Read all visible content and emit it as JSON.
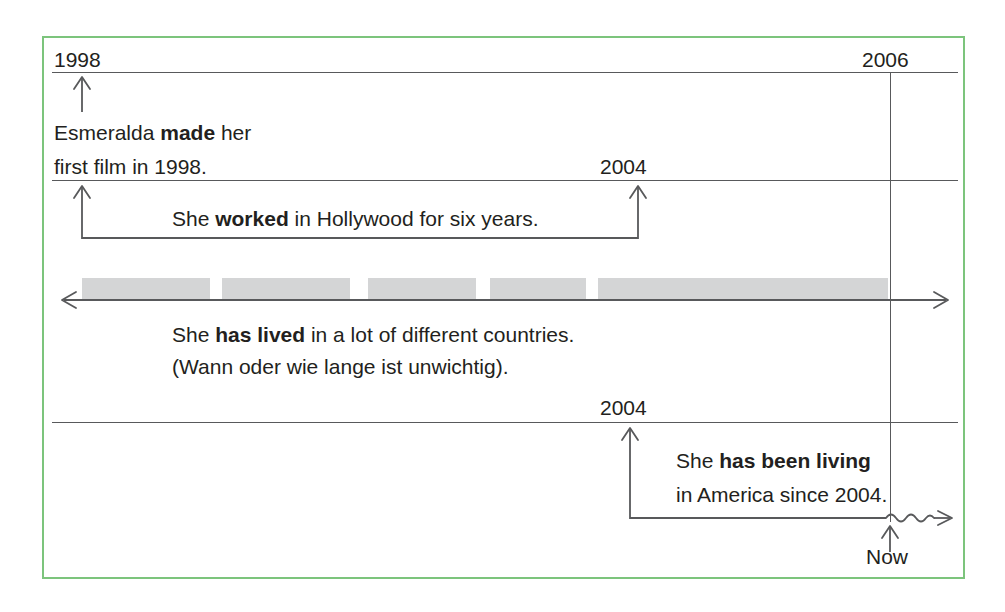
{
  "diagram": {
    "frame_color": "#7cc47c",
    "line_color": "#58595b",
    "bar_color": "#d4d5d6",
    "text_color": "#231f20"
  },
  "year_labels": {
    "start_1998": "1998",
    "end_2006": "2006",
    "mid_2004_upper": "2004",
    "mid_2004_lower": "2004",
    "now": "Now"
  },
  "statements": [
    {
      "id": "made",
      "lines": [
        {
          "pre": "Esmeralda ",
          "bold": "made",
          "post": " her"
        },
        {
          "pre": "first film in 1998.",
          "bold": "",
          "post": ""
        }
      ]
    },
    {
      "id": "worked",
      "lines": [
        {
          "pre": "She ",
          "bold": "worked",
          "post": " in Hollywood for six years."
        }
      ]
    },
    {
      "id": "has-lived",
      "lines": [
        {
          "pre": "She ",
          "bold": "has lived",
          "post": " in a lot of different countries."
        },
        {
          "pre": "(Wann oder wie lange ist unwichtig).",
          "bold": "",
          "post": ""
        }
      ]
    },
    {
      "id": "has-been-living",
      "lines": [
        {
          "pre": "She ",
          "bold": "has been living",
          "post": ""
        },
        {
          "pre": "in America since 2004.",
          "bold": "",
          "post": ""
        }
      ]
    }
  ],
  "timeline_bars": [
    {
      "left": 82,
      "width": 128
    },
    {
      "left": 222,
      "width": 128
    },
    {
      "left": 368,
      "width": 108
    },
    {
      "left": 490,
      "width": 96
    },
    {
      "left": 598,
      "width": 290
    }
  ]
}
